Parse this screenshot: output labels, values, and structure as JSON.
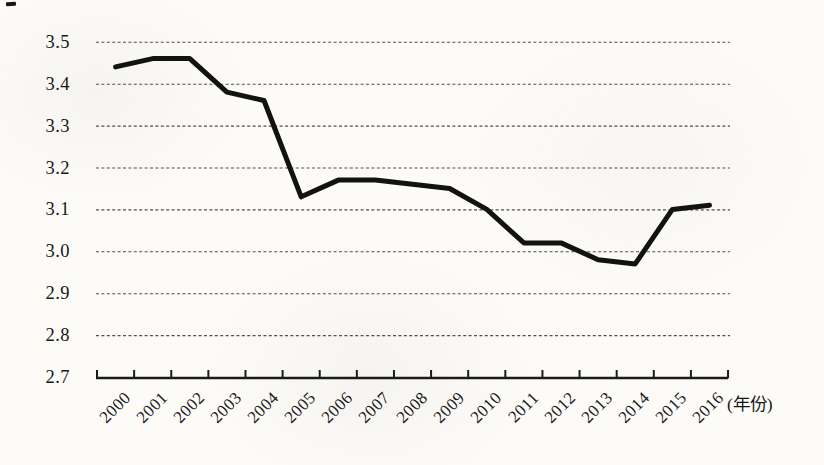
{
  "page": {
    "background": "#fcfbf8"
  },
  "colors": {
    "line": "#121212",
    "grid": "#3f3f3f",
    "axis": "#1b1b1b",
    "text": "#181818"
  },
  "chart_data": {
    "type": "line",
    "title": "",
    "categories": [
      "2000",
      "2001",
      "2002",
      "2003",
      "2004",
      "2005",
      "2006",
      "2007",
      "2008",
      "2009",
      "2010",
      "2011",
      "2012",
      "2013",
      "2014",
      "2015",
      "2016"
    ],
    "values": [
      3.44,
      3.46,
      3.46,
      3.38,
      3.36,
      3.13,
      3.17,
      3.17,
      3.16,
      3.15,
      3.1,
      3.02,
      3.02,
      2.98,
      2.97,
      3.1,
      3.11
    ],
    "xlabel": "(年份)",
    "ylabel": "",
    "ylim": [
      2.7,
      3.5
    ],
    "ytick_step": 0.1,
    "ytick_labels": [
      "3.5",
      "3.4",
      "3.3",
      "3.2",
      "3.1",
      "3.0",
      "2.9",
      "2.8",
      "2.7"
    ],
    "grid": "horizontal-dashed",
    "legend": "none",
    "line_width": 5
  }
}
